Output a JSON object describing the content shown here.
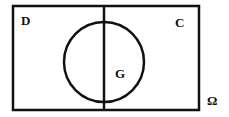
{
  "diagram": {
    "type": "venn",
    "universe_label": "Ω",
    "regions": [
      {
        "label": "D",
        "description": "left half of universe"
      },
      {
        "label": "C",
        "description": "right half of universe"
      }
    ],
    "set_label": "G",
    "colors": {
      "stroke": "#111111",
      "background": "#ffffff"
    }
  }
}
